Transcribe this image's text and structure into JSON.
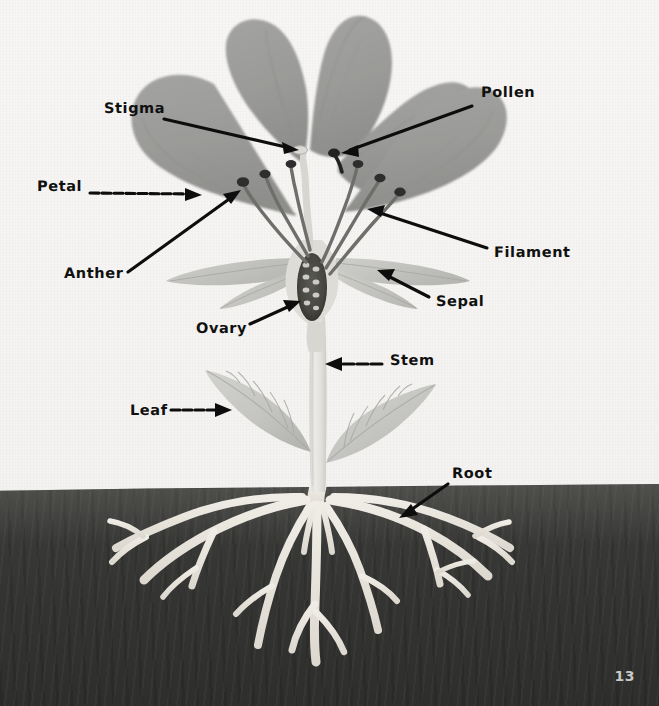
{
  "page": {
    "number": "13",
    "background_color": "#f6f5f3",
    "soil_color": "#38383"
  },
  "diagram": {
    "colors": {
      "paper": "#f6f5f3",
      "soil": "#38383 6",
      "petal": "#9b9b99",
      "petal_dark": "#8c8c8a",
      "sepal": "#c3c3bf",
      "leaf": "#c6c6c2",
      "stem": "#e2e1dd",
      "root": "#ece9e2",
      "ovary": "#4a4a47",
      "anther": "#3a3a38",
      "label_text": "#101010",
      "arrow": "#0d0d0d"
    },
    "labels": [
      {
        "id": "stigma",
        "text": "Stigma",
        "text_x": 104,
        "text_y": 110,
        "arrow_from_x": 164,
        "arrow_from_y": 119,
        "arrow_to_x": 297,
        "arrow_to_y": 150
      },
      {
        "id": "pollen",
        "text": "Pollen",
        "text_x": 481,
        "text_y": 94,
        "arrow_from_x": 472,
        "arrow_from_y": 106,
        "arrow_to_x": 340,
        "arrow_to_y": 152
      },
      {
        "id": "petal",
        "text": "Petal",
        "text_x": 37,
        "text_y": 188,
        "arrow_from_x": 90,
        "arrow_from_y": 193,
        "arrow_to_x": 200,
        "arrow_to_y": 195
      },
      {
        "id": "anther",
        "text": "Anther",
        "text_x": 64,
        "text_y": 275,
        "arrow_from_x": 128,
        "arrow_from_y": 272,
        "arrow_to_x": 240,
        "arrow_to_y": 191
      },
      {
        "id": "filament",
        "text": "Filament",
        "text_x": 494,
        "text_y": 254,
        "arrow_from_x": 487,
        "arrow_from_y": 248,
        "arrow_to_x": 367,
        "arrow_to_y": 209
      },
      {
        "id": "sepal",
        "text": "Sepal",
        "text_x": 436,
        "text_y": 303,
        "arrow_from_x": 429,
        "arrow_from_y": 297,
        "arrow_to_x": 377,
        "arrow_to_y": 270
      },
      {
        "id": "ovary",
        "text": "Ovary",
        "text_x": 196,
        "text_y": 330,
        "arrow_from_x": 250,
        "arrow_from_y": 324,
        "arrow_to_x": 300,
        "arrow_to_y": 301
      },
      {
        "id": "stem",
        "text": "Stem",
        "text_x": 390,
        "text_y": 362,
        "arrow_from_x": 382,
        "arrow_from_y": 364,
        "arrow_to_x": 325,
        "arrow_to_y": 364
      },
      {
        "id": "leaf",
        "text": "Leaf",
        "text_x": 130,
        "text_y": 412,
        "arrow_from_x": 171,
        "arrow_from_y": 410,
        "arrow_to_x": 231,
        "arrow_to_y": 410
      },
      {
        "id": "root",
        "text": "Root",
        "text_x": 452,
        "text_y": 475,
        "arrow_from_x": 448,
        "arrow_from_y": 484,
        "arrow_to_x": 400,
        "arrow_to_y": 518
      }
    ],
    "parts": {
      "petals_count": 5,
      "sepals_count": 4,
      "stamens_count": 6,
      "leaves_count": 2,
      "ovules_visible": 7
    }
  }
}
